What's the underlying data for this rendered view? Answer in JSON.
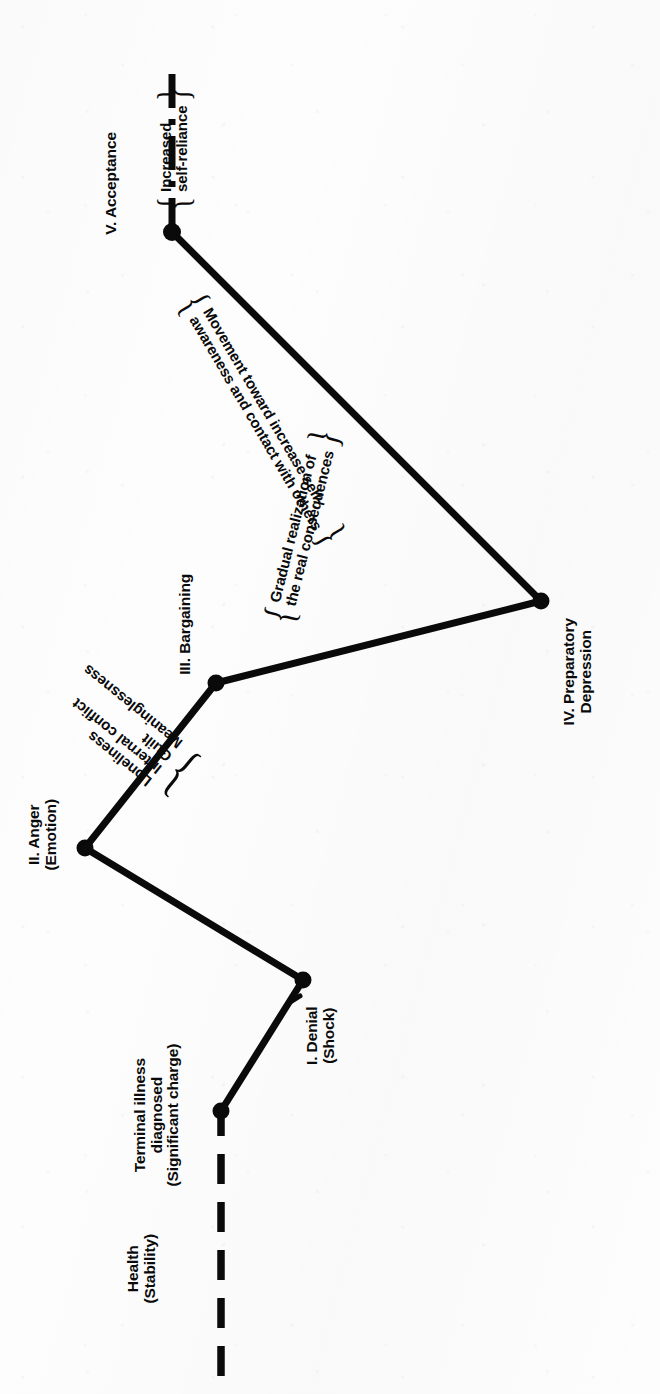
{
  "figure": {
    "orientation": "rotated-90",
    "ink_color": "#0a0a0a",
    "paper_color": "#fdfdfd"
  },
  "baseline": {
    "health_label": "Health\n(Stability)",
    "event_label": "Terminal illness\ndiagnosed\n(Significant charge)",
    "line_style": "dashed"
  },
  "stages": [
    {
      "id": "denial",
      "label": "I. Denial\n(Shock)",
      "x": 303,
      "y": 980
    },
    {
      "id": "anger",
      "label": "II. Anger\n(Emotion)",
      "x": 85,
      "y": 848
    },
    {
      "id": "bargaining",
      "label": "III. Bargaining",
      "x": 216,
      "y": 683
    },
    {
      "id": "depression",
      "label": "IV. Preparatory\nDepression",
      "x": 541,
      "y": 601
    },
    {
      "id": "acceptance",
      "label": "V. Acceptance",
      "x": 172,
      "y": 232
    }
  ],
  "annotations": [
    {
      "id": "anger-note",
      "lines": [
        "Loneliness",
        "Internal conflict",
        "Guilt",
        "Meaninglessness"
      ],
      "brace": "}"
    },
    {
      "id": "bargaining-note",
      "lines": [
        "Gradual realization of",
        "the real consequences"
      ],
      "brace": "{"
    },
    {
      "id": "acceptance-movement-note",
      "lines": [
        "Movement toward increase self-",
        "awareness and contact with others"
      ],
      "brace": "{"
    },
    {
      "id": "self-reliance-note",
      "lines": [
        "Increased",
        "self-reliance"
      ],
      "brace": "{"
    }
  ],
  "endline": {
    "style": "dash-dot"
  }
}
